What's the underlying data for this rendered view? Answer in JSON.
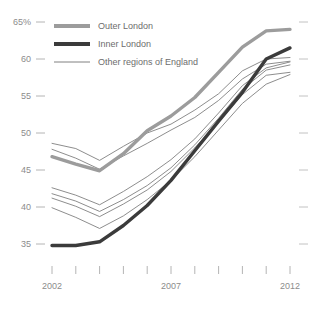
{
  "chart_data": {
    "type": "line",
    "title": "",
    "subtitle": "",
    "xlabel": "",
    "ylabel": "",
    "x": [
      2002,
      2003,
      2004,
      2005,
      2006,
      2007,
      2008,
      2009,
      2010,
      2011,
      2012
    ],
    "x_tick_labels": [
      "2002",
      "",
      "",
      "",
      "",
      "2007",
      "",
      "",
      "",
      "",
      "2012"
    ],
    "y_tick_labels": [
      "65%",
      "60",
      "55",
      "50",
      "45",
      "40",
      "35"
    ],
    "y_ticks": [
      65,
      60,
      55,
      50,
      45,
      40,
      35
    ],
    "ylim": [
      33,
      66
    ],
    "xlim": [
      2002,
      2012
    ],
    "grid": false,
    "legend_position": "top-left",
    "series": [
      {
        "name": "Outer London",
        "color": "#9c9c9c",
        "width": 3.4,
        "values": [
          46.8,
          45.8,
          44.9,
          47.2,
          50.3,
          52.3,
          54.8,
          58.2,
          61.6,
          63.8,
          64.0
        ]
      },
      {
        "name": "Inner London",
        "color": "#3b3b3b",
        "width": 3.4,
        "values": [
          34.8,
          34.8,
          35.3,
          37.5,
          40.2,
          43.6,
          47.6,
          51.6,
          55.5,
          60.0,
          61.5
        ]
      },
      {
        "name": "Other regions of England",
        "color": "#808080",
        "width": 0.9,
        "values": [
          48.6,
          47.9,
          46.3,
          48.2,
          50.0,
          51.2,
          53.1,
          55.3,
          58.4,
          60.0,
          60.2
        ]
      },
      {
        "name": "Other regions of England",
        "color": "#808080",
        "width": 0.9,
        "values": [
          47.8,
          46.6,
          45.1,
          46.9,
          48.6,
          50.4,
          52.1,
          54.4,
          57.3,
          59.3,
          59.7
        ]
      },
      {
        "name": "Other regions of England",
        "color": "#808080",
        "width": 0.9,
        "values": [
          42.6,
          41.6,
          40.3,
          42.1,
          44.1,
          46.4,
          49.2,
          52.7,
          56.4,
          58.8,
          59.6
        ]
      },
      {
        "name": "Other regions of England",
        "color": "#808080",
        "width": 0.9,
        "values": [
          41.8,
          40.8,
          39.4,
          41.0,
          42.9,
          45.3,
          48.4,
          52.0,
          55.9,
          58.5,
          59.2
        ]
      },
      {
        "name": "Other regions of England",
        "color": "#808080",
        "width": 0.9,
        "values": [
          41.2,
          40.1,
          38.7,
          40.4,
          42.3,
          44.8,
          48.0,
          51.5,
          55.2,
          57.8,
          58.2
        ]
      },
      {
        "name": "Other regions of England",
        "color": "#808080",
        "width": 0.9,
        "values": [
          39.9,
          38.6,
          37.1,
          38.8,
          41.0,
          43.6,
          46.8,
          50.4,
          54.0,
          56.6,
          57.9
        ]
      }
    ],
    "legend": [
      {
        "label": "Outer London",
        "color": "#9c9c9c",
        "style": "thick"
      },
      {
        "label": "Inner London",
        "color": "#3b3b3b",
        "style": "thick"
      },
      {
        "label": "Other regions of England",
        "color": "#808080",
        "style": "thin"
      }
    ]
  }
}
